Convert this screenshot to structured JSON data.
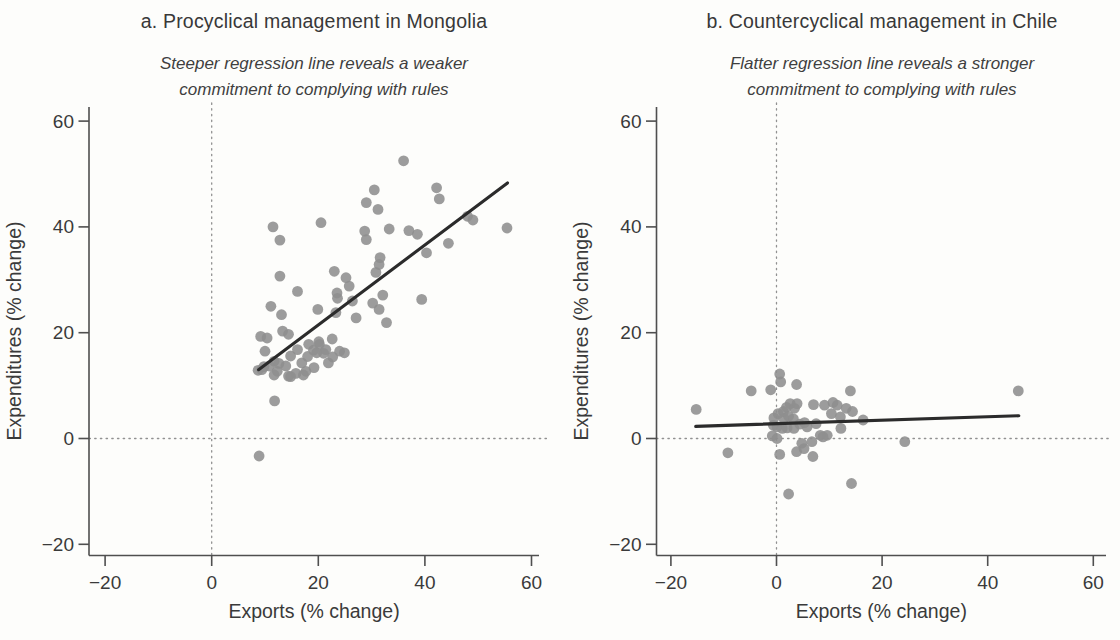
{
  "figure": {
    "background": "#fdfdfb",
    "text_color": "#3a3a3a",
    "point_color": "#8e8e8e",
    "regression_line_color": "#2b2b2b",
    "dotted_line_color": "#919191",
    "axis_color": "#4f4f4f"
  },
  "chart_data": [
    {
      "type": "scatter",
      "panel_label": "a",
      "title": "a. Procyclical management in Mongolia",
      "subtitle": [
        "Steeper regression line reveals a weaker",
        "commitment to complying with rules"
      ],
      "xlabel": "Exports (% change)",
      "ylabel": "Expenditures (% change)",
      "x_ticks": [
        -20,
        0,
        20,
        40,
        60
      ],
      "y_ticks": [
        -20,
        0,
        20,
        40,
        60
      ],
      "xlim": [
        -23,
        62
      ],
      "ylim": [
        -22,
        62
      ],
      "grid": false,
      "ref_lines": {
        "x": 0,
        "y": 0,
        "style": "dotted"
      },
      "regression_line": {
        "x1": 8.8,
        "y1": 13.0,
        "x2": 55.5,
        "y2": 48.3,
        "slope_note": "steep (~0.75)"
      },
      "points": [
        [
          36.0,
          52.5
        ],
        [
          30.5,
          47.0
        ],
        [
          42.2,
          47.4
        ],
        [
          42.7,
          45.3
        ],
        [
          29.0,
          44.6
        ],
        [
          31.2,
          43.3
        ],
        [
          11.5,
          40.0
        ],
        [
          20.5,
          40.8
        ],
        [
          12.8,
          37.5
        ],
        [
          28.7,
          39.2
        ],
        [
          29.0,
          37.6
        ],
        [
          33.3,
          39.6
        ],
        [
          37.0,
          39.3
        ],
        [
          38.6,
          38.6
        ],
        [
          44.4,
          36.9
        ],
        [
          48.0,
          42.0
        ],
        [
          49.0,
          41.3
        ],
        [
          55.4,
          39.8
        ],
        [
          40.3,
          35.1
        ],
        [
          12.8,
          30.7
        ],
        [
          16.1,
          27.8
        ],
        [
          23.0,
          31.6
        ],
        [
          23.5,
          27.5
        ],
        [
          25.2,
          30.4
        ],
        [
          25.8,
          28.8
        ],
        [
          30.8,
          31.4
        ],
        [
          31.4,
          32.9
        ],
        [
          31.6,
          34.2
        ],
        [
          32.1,
          27.1
        ],
        [
          30.2,
          25.6
        ],
        [
          31.4,
          24.4
        ],
        [
          26.4,
          26.0
        ],
        [
          27.1,
          22.8
        ],
        [
          32.8,
          21.9
        ],
        [
          39.4,
          26.3
        ],
        [
          19.9,
          24.4
        ],
        [
          23.3,
          23.8
        ],
        [
          23.6,
          26.5
        ],
        [
          11.1,
          25.0
        ],
        [
          13.1,
          23.4
        ],
        [
          9.2,
          19.3
        ],
        [
          10.4,
          19.0
        ],
        [
          10.0,
          16.5
        ],
        [
          11.7,
          14.6
        ],
        [
          10.8,
          13.7
        ],
        [
          9.4,
          13.0
        ],
        [
          12.3,
          12.7
        ],
        [
          13.9,
          13.7
        ],
        [
          14.8,
          15.6
        ],
        [
          14.4,
          19.7
        ],
        [
          16.1,
          16.8
        ],
        [
          16.9,
          14.3
        ],
        [
          15.8,
          12.3
        ],
        [
          14.4,
          11.8
        ],
        [
          17.7,
          12.7
        ],
        [
          19.2,
          13.4
        ],
        [
          19.7,
          16.2
        ],
        [
          20.2,
          17.8
        ],
        [
          21.4,
          16.8
        ],
        [
          21.9,
          14.3
        ],
        [
          22.7,
          15.4
        ],
        [
          24.0,
          16.5
        ],
        [
          24.9,
          16.2
        ],
        [
          18.2,
          17.8
        ],
        [
          8.7,
          12.9
        ],
        [
          9.8,
          13.6
        ],
        [
          11.7,
          12.0
        ],
        [
          12.6,
          14.2
        ],
        [
          13.3,
          20.3
        ],
        [
          14.8,
          11.7
        ],
        [
          17.2,
          12.0
        ],
        [
          18.0,
          15.5
        ],
        [
          19.1,
          16.7
        ],
        [
          20.1,
          18.3
        ],
        [
          21.0,
          16.1
        ],
        [
          22.6,
          18.8
        ],
        [
          11.8,
          7.1
        ],
        [
          8.9,
          -3.3
        ]
      ]
    },
    {
      "type": "scatter",
      "panel_label": "b",
      "title": "b. Countercyclical management in Chile",
      "subtitle": [
        "Flatter regression line reveals a stronger",
        "commitment to complying with rules"
      ],
      "xlabel": "Exports (% change)",
      "ylabel": "Expenditures (% change)",
      "x_ticks": [
        -20,
        0,
        20,
        40,
        60
      ],
      "y_ticks": [
        -20,
        0,
        20,
        40,
        60
      ],
      "xlim": [
        -23,
        62
      ],
      "ylim": [
        -22,
        62
      ],
      "grid": false,
      "ref_lines": {
        "x": 0,
        "y": 0,
        "style": "dotted"
      },
      "regression_line": {
        "x1": -15.3,
        "y1": 2.3,
        "x2": 45.9,
        "y2": 4.3,
        "slope_note": "flat (~0.03)"
      },
      "points": [
        [
          -15.2,
          5.5
        ],
        [
          -9.2,
          -2.7
        ],
        [
          -4.8,
          9.0
        ],
        [
          -1.1,
          9.2
        ],
        [
          0.6,
          12.2
        ],
        [
          0.8,
          10.7
        ],
        [
          3.8,
          10.2
        ],
        [
          -0.5,
          3.9
        ],
        [
          0.3,
          4.7
        ],
        [
          1.3,
          5.1
        ],
        [
          1.9,
          5.9
        ],
        [
          2.6,
          6.6
        ],
        [
          3.4,
          5.7
        ],
        [
          3.9,
          6.6
        ],
        [
          1.4,
          3.8
        ],
        [
          2.3,
          4.2
        ],
        [
          3.2,
          3.7
        ],
        [
          -0.6,
          2.5
        ],
        [
          0.1,
          2.2
        ],
        [
          1.1,
          1.9
        ],
        [
          2.0,
          2.0
        ],
        [
          -0.8,
          0.5
        ],
        [
          0.1,
          0.0
        ],
        [
          3.3,
          1.9
        ],
        [
          4.4,
          2.7
        ],
        [
          5.3,
          3.0
        ],
        [
          5.8,
          2.2
        ],
        [
          7.0,
          6.4
        ],
        [
          7.5,
          2.8
        ],
        [
          8.3,
          0.6
        ],
        [
          9.1,
          6.3
        ],
        [
          9.6,
          0.6
        ],
        [
          10.4,
          4.7
        ],
        [
          10.7,
          6.8
        ],
        [
          11.5,
          6.3
        ],
        [
          12.1,
          4.1
        ],
        [
          12.2,
          1.9
        ],
        [
          13.2,
          5.7
        ],
        [
          14.0,
          9.0
        ],
        [
          14.4,
          5.1
        ],
        [
          16.4,
          3.5
        ],
        [
          4.8,
          -0.9
        ],
        [
          5.2,
          -1.9
        ],
        [
          6.7,
          -0.6
        ],
        [
          6.9,
          -3.4
        ],
        [
          8.8,
          0.3
        ],
        [
          0.6,
          -3.0
        ],
        [
          3.8,
          -2.5
        ],
        [
          14.2,
          -8.5
        ],
        [
          2.3,
          -10.5
        ],
        [
          24.3,
          -0.6
        ],
        [
          45.8,
          9.0
        ]
      ]
    }
  ]
}
